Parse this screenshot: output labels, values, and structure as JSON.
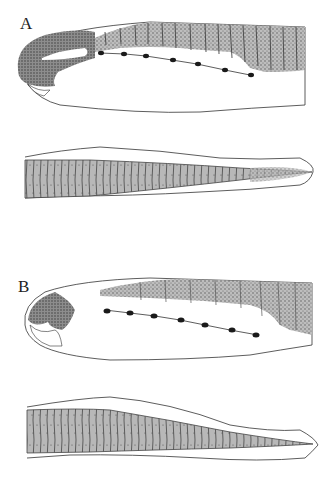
{
  "figure": {
    "panels": [
      {
        "label": "A",
        "views": [
          "lateral-head-body",
          "posterior-tail"
        ],
        "melanophores_count": 7
      },
      {
        "label": "B",
        "views": [
          "lateral-head-body",
          "posterior-tail"
        ],
        "melanophores_count": 7
      }
    ],
    "colors": {
      "stipple": "#9a9a9a",
      "stipple_dark": "#6a6a6a",
      "outline": "#333333",
      "melanophore": "#1a1a1a",
      "background": "#ffffff"
    }
  }
}
